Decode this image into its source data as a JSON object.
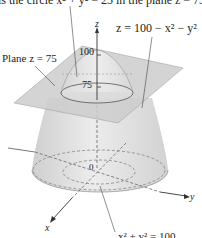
{
  "figure": {
    "caption_top": "is the circle x² + y² = 25 in the plane z = 75.",
    "surface_equation": "z = 100 − x² − y²",
    "plane_label": "Plane z = 75",
    "z_ticks": [
      "100",
      "75"
    ],
    "axes": {
      "x": "x",
      "y": "y",
      "z": "z"
    },
    "origin_label": "0",
    "bottom_equation": "x² + y² = 100",
    "colors": {
      "surface_fill": "#d9d9d9",
      "plane_fill": "#c8c8c8",
      "outline": "#555555",
      "text": "#231f20"
    }
  }
}
